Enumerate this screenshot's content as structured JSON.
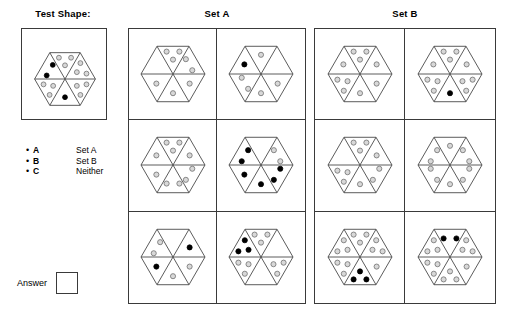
{
  "test_shape": {
    "title": "Test Shape:",
    "hexagon": {
      "sectors": [
        {
          "name": "top",
          "dots": [
            {
              "color": "gray"
            },
            {
              "color": "gray"
            },
            {
              "color": "gray"
            }
          ]
        },
        {
          "name": "upper-right",
          "dots": [
            {
              "color": "gray"
            },
            {
              "color": "gray"
            },
            {
              "color": "gray"
            }
          ]
        },
        {
          "name": "lower-right",
          "dots": [
            {
              "color": "gray"
            },
            {
              "color": "gray"
            },
            {
              "color": "gray"
            }
          ]
        },
        {
          "name": "bottom",
          "dots": [
            {
              "color": "black"
            }
          ]
        },
        {
          "name": "lower-left",
          "dots": [
            {
              "color": "gray"
            },
            {
              "color": "gray"
            },
            {
              "color": "gray"
            }
          ]
        },
        {
          "name": "upper-left",
          "dots": [
            {
              "color": "black"
            },
            {
              "color": "black"
            }
          ]
        }
      ]
    }
  },
  "legend": {
    "items": [
      {
        "bullet": "•",
        "key": "A",
        "value": "Set A"
      },
      {
        "bullet": "•",
        "key": "B",
        "value": "Set B"
      },
      {
        "bullet": "•",
        "key": "C",
        "value": "Neither"
      }
    ]
  },
  "answer": {
    "label": "Answer",
    "value": ""
  },
  "sets": [
    {
      "name": "set-a",
      "title": "Set A",
      "cells": [
        {
          "row": 0,
          "col": 0,
          "sectors": [
            {
              "name": "top",
              "dots": [
                {
                  "color": "gray"
                },
                {
                  "color": "gray"
                },
                {
                  "color": "gray"
                }
              ]
            },
            {
              "name": "upper-right",
              "dots": [
                {
                  "color": "gray"
                },
                {
                  "color": "gray"
                }
              ]
            },
            {
              "name": "lower-right",
              "dots": [
                {
                  "color": "gray"
                }
              ]
            },
            {
              "name": "bottom",
              "dots": [
                {
                  "color": "gray"
                }
              ]
            },
            {
              "name": "lower-left",
              "dots": [
                {
                  "color": "gray"
                }
              ]
            },
            {
              "name": "upper-left",
              "dots": []
            }
          ]
        },
        {
          "row": 0,
          "col": 1,
          "sectors": [
            {
              "name": "top",
              "dots": [
                {
                  "color": "gray"
                }
              ]
            },
            {
              "name": "upper-right",
              "dots": []
            },
            {
              "name": "lower-right",
              "dots": [
                {
                  "color": "gray"
                }
              ]
            },
            {
              "name": "bottom",
              "dots": [
                {
                  "color": "gray"
                }
              ]
            },
            {
              "name": "lower-left",
              "dots": [
                {
                  "color": "gray"
                },
                {
                  "color": "gray"
                }
              ]
            },
            {
              "name": "upper-left",
              "dots": [
                {
                  "color": "black"
                }
              ]
            }
          ]
        },
        {
          "row": 1,
          "col": 0,
          "sectors": [
            {
              "name": "top",
              "dots": [
                {
                  "color": "gray"
                },
                {
                  "color": "gray"
                },
                {
                  "color": "gray"
                }
              ]
            },
            {
              "name": "upper-right",
              "dots": [
                {
                  "color": "gray"
                }
              ]
            },
            {
              "name": "lower-right",
              "dots": [
                {
                  "color": "gray"
                },
                {
                  "color": "gray"
                }
              ]
            },
            {
              "name": "bottom",
              "dots": [
                {
                  "color": "gray"
                },
                {
                  "color": "gray"
                }
              ]
            },
            {
              "name": "lower-left",
              "dots": [
                {
                  "color": "gray"
                }
              ]
            },
            {
              "name": "upper-left",
              "dots": [
                {
                  "color": "gray"
                }
              ]
            }
          ]
        },
        {
          "row": 1,
          "col": 1,
          "sectors": [
            {
              "name": "top",
              "dots": []
            },
            {
              "name": "upper-right",
              "dots": [
                {
                  "color": "gray"
                },
                {
                  "color": "gray"
                }
              ]
            },
            {
              "name": "lower-right",
              "dots": [
                {
                  "color": "black"
                },
                {
                  "color": "black"
                }
              ]
            },
            {
              "name": "bottom",
              "dots": [
                {
                  "color": "black"
                }
              ]
            },
            {
              "name": "lower-left",
              "dots": [
                {
                  "color": "black"
                }
              ]
            },
            {
              "name": "upper-left",
              "dots": [
                {
                  "color": "black"
                },
                {
                  "color": "black"
                }
              ]
            }
          ]
        },
        {
          "row": 2,
          "col": 0,
          "sectors": [
            {
              "name": "top",
              "dots": []
            },
            {
              "name": "upper-right",
              "dots": [
                {
                  "color": "black"
                }
              ]
            },
            {
              "name": "lower-right",
              "dots": [
                {
                  "color": "gray"
                }
              ]
            },
            {
              "name": "bottom",
              "dots": [
                {
                  "color": "gray"
                }
              ]
            },
            {
              "name": "lower-left",
              "dots": [
                {
                  "color": "black"
                }
              ]
            },
            {
              "name": "upper-left",
              "dots": [
                {
                  "color": "gray"
                },
                {
                  "color": "gray"
                }
              ]
            }
          ]
        },
        {
          "row": 2,
          "col": 1,
          "sectors": [
            {
              "name": "top",
              "dots": [
                {
                  "color": "gray"
                },
                {
                  "color": "gray"
                },
                {
                  "color": "gray"
                }
              ]
            },
            {
              "name": "upper-right",
              "dots": []
            },
            {
              "name": "lower-right",
              "dots": [
                {
                  "color": "gray"
                },
                {
                  "color": "gray"
                },
                {
                  "color": "gray"
                }
              ]
            },
            {
              "name": "bottom",
              "dots": []
            },
            {
              "name": "lower-left",
              "dots": [
                {
                  "color": "gray"
                },
                {
                  "color": "gray"
                },
                {
                  "color": "gray"
                }
              ]
            },
            {
              "name": "upper-left",
              "dots": [
                {
                  "color": "black"
                },
                {
                  "color": "black"
                },
                {
                  "color": "black"
                }
              ]
            }
          ]
        }
      ]
    },
    {
      "name": "set-b",
      "title": "Set B",
      "cells": [
        {
          "row": 0,
          "col": 0,
          "sectors": [
            {
              "name": "top",
              "dots": [
                {
                  "color": "gray"
                },
                {
                  "color": "gray"
                },
                {
                  "color": "gray"
                }
              ]
            },
            {
              "name": "upper-right",
              "dots": [
                {
                  "color": "gray"
                }
              ]
            },
            {
              "name": "lower-right",
              "dots": [
                {
                  "color": "gray"
                }
              ]
            },
            {
              "name": "bottom",
              "dots": [
                {
                  "color": "gray"
                }
              ]
            },
            {
              "name": "lower-left",
              "dots": [
                {
                  "color": "gray"
                },
                {
                  "color": "gray"
                },
                {
                  "color": "gray"
                }
              ]
            },
            {
              "name": "upper-left",
              "dots": [
                {
                  "color": "gray"
                }
              ]
            }
          ]
        },
        {
          "row": 0,
          "col": 1,
          "sectors": [
            {
              "name": "top",
              "dots": [
                {
                  "color": "gray"
                },
                {
                  "color": "gray"
                },
                {
                  "color": "gray"
                }
              ]
            },
            {
              "name": "upper-right",
              "dots": [
                {
                  "color": "gray"
                }
              ]
            },
            {
              "name": "lower-right",
              "dots": [
                {
                  "color": "gray"
                },
                {
                  "color": "gray"
                },
                {
                  "color": "gray"
                }
              ]
            },
            {
              "name": "bottom",
              "dots": [
                {
                  "color": "black"
                }
              ]
            },
            {
              "name": "lower-left",
              "dots": [
                {
                  "color": "gray"
                },
                {
                  "color": "gray"
                },
                {
                  "color": "gray"
                }
              ]
            },
            {
              "name": "upper-left",
              "dots": [
                {
                  "color": "gray"
                }
              ]
            }
          ]
        },
        {
          "row": 1,
          "col": 0,
          "sectors": [
            {
              "name": "top",
              "dots": [
                {
                  "color": "gray"
                },
                {
                  "color": "gray"
                },
                {
                  "color": "gray"
                }
              ]
            },
            {
              "name": "upper-right",
              "dots": [
                {
                  "color": "gray"
                }
              ]
            },
            {
              "name": "lower-right",
              "dots": [
                {
                  "color": "gray"
                },
                {
                  "color": "gray"
                }
              ]
            },
            {
              "name": "bottom",
              "dots": [
                {
                  "color": "gray"
                }
              ]
            },
            {
              "name": "lower-left",
              "dots": [
                {
                  "color": "gray"
                },
                {
                  "color": "gray"
                },
                {
                  "color": "gray"
                }
              ]
            },
            {
              "name": "upper-left",
              "dots": []
            }
          ]
        },
        {
          "row": 1,
          "col": 1,
          "sectors": [
            {
              "name": "top",
              "dots": [
                {
                  "color": "gray"
                }
              ]
            },
            {
              "name": "upper-right",
              "dots": [
                {
                  "color": "gray"
                },
                {
                  "color": "gray"
                }
              ]
            },
            {
              "name": "lower-right",
              "dots": [
                {
                  "color": "gray"
                },
                {
                  "color": "gray"
                }
              ]
            },
            {
              "name": "bottom",
              "dots": [
                {
                  "color": "gray"
                }
              ]
            },
            {
              "name": "lower-left",
              "dots": [
                {
                  "color": "gray"
                },
                {
                  "color": "gray"
                }
              ]
            },
            {
              "name": "upper-left",
              "dots": [
                {
                  "color": "gray"
                },
                {
                  "color": "gray"
                }
              ]
            }
          ]
        },
        {
          "row": 2,
          "col": 0,
          "sectors": [
            {
              "name": "top",
              "dots": [
                {
                  "color": "gray"
                },
                {
                  "color": "gray"
                },
                {
                  "color": "gray"
                }
              ]
            },
            {
              "name": "upper-right",
              "dots": [
                {
                  "color": "gray"
                },
                {
                  "color": "gray"
                },
                {
                  "color": "gray"
                }
              ]
            },
            {
              "name": "lower-right",
              "dots": [
                {
                  "color": "gray"
                }
              ]
            },
            {
              "name": "bottom",
              "dots": [
                {
                  "color": "black"
                },
                {
                  "color": "black"
                },
                {
                  "color": "black"
                }
              ]
            },
            {
              "name": "lower-left",
              "dots": [
                {
                  "color": "gray"
                },
                {
                  "color": "gray"
                },
                {
                  "color": "gray"
                }
              ]
            },
            {
              "name": "upper-left",
              "dots": [
                {
                  "color": "gray"
                },
                {
                  "color": "gray"
                },
                {
                  "color": "gray"
                }
              ]
            }
          ]
        },
        {
          "row": 2,
          "col": 1,
          "sectors": [
            {
              "name": "top",
              "dots": [
                {
                  "color": "black"
                },
                {
                  "color": "black"
                }
              ]
            },
            {
              "name": "upper-right",
              "dots": [
                {
                  "color": "gray"
                },
                {
                  "color": "gray"
                },
                {
                  "color": "gray"
                }
              ]
            },
            {
              "name": "lower-right",
              "dots": [
                {
                  "color": "gray"
                }
              ]
            },
            {
              "name": "bottom",
              "dots": [
                {
                  "color": "gray"
                },
                {
                  "color": "gray"
                },
                {
                  "color": "gray"
                }
              ]
            },
            {
              "name": "lower-left",
              "dots": [
                {
                  "color": "gray"
                },
                {
                  "color": "gray"
                },
                {
                  "color": "gray"
                }
              ]
            },
            {
              "name": "upper-left",
              "dots": [
                {
                  "color": "gray"
                },
                {
                  "color": "gray"
                },
                {
                  "color": "gray"
                }
              ]
            }
          ]
        }
      ]
    }
  ],
  "colors": {
    "dot_gray_fill": "#d8d8d8",
    "dot_gray_stroke": "#707070",
    "dot_black": "#000000",
    "line": "#4a4a4a",
    "border": "#3a3a3a",
    "background": "#ffffff"
  }
}
